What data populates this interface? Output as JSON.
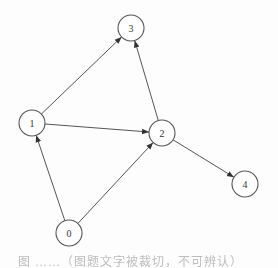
{
  "diagram": {
    "type": "directed-graph",
    "node_radius": 13,
    "colors": {
      "stroke": "#555555",
      "fill": "#ffffff",
      "text": "#333333",
      "background": "#fdfdfd"
    },
    "nodes": [
      {
        "id": "0",
        "label": "0",
        "x": 69,
        "y": 233
      },
      {
        "id": "1",
        "label": "1",
        "x": 32,
        "y": 123
      },
      {
        "id": "2",
        "label": "2",
        "x": 162,
        "y": 133
      },
      {
        "id": "3",
        "label": "3",
        "x": 131,
        "y": 28
      },
      {
        "id": "4",
        "label": "4",
        "x": 245,
        "y": 184
      }
    ],
    "edges": [
      {
        "from": "1",
        "to": "3"
      },
      {
        "from": "2",
        "to": "3"
      },
      {
        "from": "1",
        "to": "2"
      },
      {
        "from": "0",
        "to": "1"
      },
      {
        "from": "0",
        "to": "2"
      },
      {
        "from": "2",
        "to": "4"
      }
    ]
  },
  "caption": {
    "text": "图 ……（图题文字被裁切，不可辨认）"
  }
}
